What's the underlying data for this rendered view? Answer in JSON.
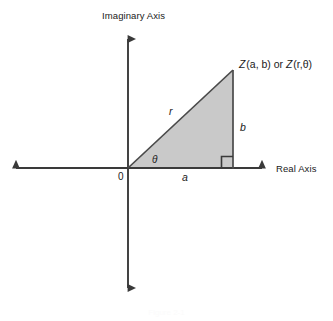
{
  "figure": {
    "title_caption": "Figure 2-1",
    "axes": {
      "vertical_label": "Imaginary Axis",
      "horizontal_label": "Real Axis",
      "origin_label": "0"
    },
    "annotations": {
      "point_label_prefix": "Z",
      "point_label_rect": "(a, b)",
      "point_label_conjunction": "or",
      "point_label_polar": "(r,θ)",
      "hypotenuse_label": "r",
      "opposite_label": "b",
      "adjacent_label": "a",
      "angle_label": "θ"
    },
    "colors": {
      "stroke": "#3a3a3a",
      "triangle_fill": "#c9c9c9",
      "triangle_edge": "#4a4a4a",
      "background": "#ffffff",
      "text": "#1a1a1a"
    },
    "geometry": {
      "origin_x": 128,
      "origin_y": 168,
      "apex_x": 233,
      "apex_y": 70,
      "foot_x": 233,
      "foot_y": 168,
      "axis_left_x": 8,
      "axis_right_x": 270,
      "axis_top_y": 31,
      "axis_bottom_y": 296
    }
  }
}
